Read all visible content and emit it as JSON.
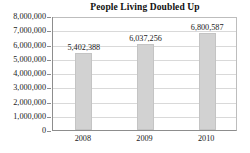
{
  "chart_data": {
    "type": "bar",
    "title": "People Living Doubled Up",
    "categories": [
      "2008",
      "2009",
      "2010"
    ],
    "values": [
      5402388,
      6037256,
      6800587
    ],
    "data_labels": [
      "5,402,388",
      "6,037,256",
      "6,800,587"
    ],
    "xlabel": "",
    "ylabel": "",
    "ylim": [
      0,
      8000000
    ],
    "ytick_labels": [
      "8,000,000",
      "7,000,000",
      "6,000,000",
      "5,000,000",
      "4,000,000",
      "3,000,000",
      "2,000,000",
      "1,000,000",
      "0"
    ],
    "ytick_values": [
      8000000,
      7000000,
      6000000,
      5000000,
      4000000,
      3000000,
      2000000,
      1000000,
      0
    ],
    "grid": true,
    "legend": false,
    "bar_color": "#d2d2d2",
    "bar_edge_color": "#c4c4c4",
    "grid_color": "#d9d9d9",
    "axis_color": "#8d8d8d",
    "text_color": "#1a1a1a",
    "background": "#ffffff"
  }
}
